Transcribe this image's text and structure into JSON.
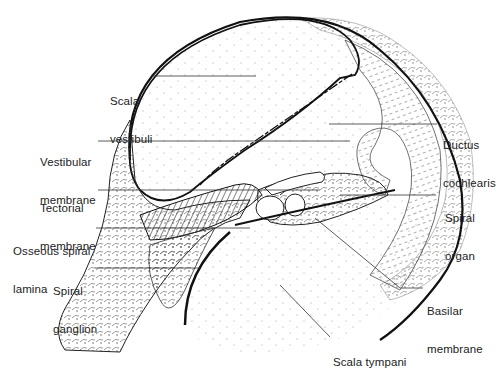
{
  "figure": {
    "colors": {
      "ink": "#1a1a1a",
      "leader": "#333333",
      "background": "#ffffff",
      "stipple": "#9a9a9a"
    }
  },
  "labels": [
    {
      "id": "scala-vestibuli",
      "lines": [
        "Scala",
        "vestibuli"
      ],
      "x": 110,
      "y": 70
    },
    {
      "id": "vestibular-membrane",
      "lines": [
        "Vestibular",
        "membrane"
      ],
      "x": 40,
      "y": 131
    },
    {
      "id": "tectorial-membrane",
      "lines": [
        "Tectorial",
        "membrane"
      ],
      "x": 40,
      "y": 177
    },
    {
      "id": "osseous-spiral-lamina",
      "lines": [
        "Osseous spiral",
        "lamina"
      ],
      "x": 13,
      "y": 220
    },
    {
      "id": "spiral-ganglion",
      "lines": [
        "Spiral",
        "ganglion"
      ],
      "x": 53,
      "y": 260
    },
    {
      "id": "ductus-cochlearis",
      "lines": [
        "Ductus",
        "cochlearis"
      ],
      "x": 443,
      "y": 114
    },
    {
      "id": "spiral-organ",
      "lines": [
        "Spiral",
        "organ"
      ],
      "x": 445,
      "y": 187
    },
    {
      "id": "basilar-membrane",
      "lines": [
        "Basilar",
        "membrane"
      ],
      "x": 427,
      "y": 280
    },
    {
      "id": "scala-tympani",
      "lines": [
        "Scala tympani"
      ],
      "x": 333,
      "y": 331
    }
  ],
  "leaders": [
    {
      "for": "scala-vestibuli",
      "points": "151,76 256,76"
    },
    {
      "for": "vestibular-membrane",
      "points": "98,141 350,141"
    },
    {
      "for": "tectorial-membrane",
      "points": "98,190 320,190"
    },
    {
      "for": "osseous-spiral-lamina",
      "points": "96,228 250,228"
    },
    {
      "for": "spiral-ganglion",
      "points": "95,268 200,268"
    },
    {
      "for": "ductus-cochlearis",
      "points": "329,124 437,124"
    },
    {
      "for": "spiral-organ",
      "points": "340,195 436,195"
    },
    {
      "for": "basilar-membrane",
      "points": "315,218 400,288 423,288"
    },
    {
      "for": "scala-tympani",
      "points": "280,285 330,337"
    }
  ]
}
